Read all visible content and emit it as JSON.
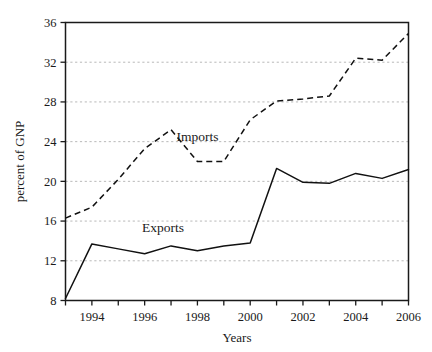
{
  "chart_data": {
    "type": "line",
    "title": "",
    "xlabel": "Years",
    "ylabel": "percent of GNP",
    "x": [
      1993,
      1994,
      1995,
      1996,
      1997,
      1998,
      1999,
      2000,
      2001,
      2002,
      2003,
      2004,
      2005,
      2006
    ],
    "xlim": [
      1993,
      2006
    ],
    "ylim": [
      8,
      36
    ],
    "y_ticks": [
      8,
      12,
      16,
      20,
      24,
      28,
      32,
      36
    ],
    "y_tick_labels": [
      "8",
      "12",
      "16",
      "20",
      "24",
      "28",
      "32",
      "36"
    ],
    "x_ticks": [
      1994,
      1996,
      1998,
      2000,
      2002,
      2004,
      2006
    ],
    "x_tick_labels": [
      "1994",
      "1996",
      "1998",
      "2000",
      "2002",
      "2004",
      "2006"
    ],
    "x_minor_ticks": [
      1993,
      1995,
      1997,
      1999,
      2001,
      2003,
      2005
    ],
    "grid": "horizontal-dashed",
    "legend": "inline-annotations",
    "series": [
      {
        "name": "Imports",
        "style": "dashed",
        "color": "#111111",
        "label_x": 1998.0,
        "label_y": 24.1,
        "values": [
          16.3,
          17.4,
          20.2,
          23.3,
          25.2,
          22.0,
          22.0,
          26.2,
          28.1,
          28.3,
          28.6,
          32.4,
          32.2,
          34.9
        ]
      },
      {
        "name": "Exports",
        "style": "solid",
        "color": "#111111",
        "label_x": 1996.7,
        "label_y": 14.9,
        "values": [
          8.2,
          13.7,
          13.2,
          12.7,
          13.5,
          13.0,
          13.5,
          13.8,
          21.3,
          19.9,
          19.8,
          20.8,
          20.3,
          21.2
        ]
      }
    ],
    "annotations": [
      {
        "text": "Imports",
        "x": 1998.0,
        "y": 24.1
      },
      {
        "text": "Exports",
        "x": 1996.7,
        "y": 14.9
      }
    ]
  }
}
